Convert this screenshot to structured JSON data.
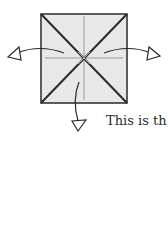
{
  "diagram": {
    "type": "origami-fold-diagram",
    "paper_square": {
      "fill": "#e8e8e8",
      "stroke": "#2a2a2a"
    },
    "creases": {
      "diagonal_color": "#2a2a2a",
      "center_line_color": "#9a9a9a"
    },
    "arrows": [
      {
        "name": "left-arrow",
        "direction": "left"
      },
      {
        "name": "right-arrow",
        "direction": "right"
      },
      {
        "name": "down-arrow",
        "direction": "down"
      }
    ]
  },
  "caption": {
    "text": "This is th"
  }
}
